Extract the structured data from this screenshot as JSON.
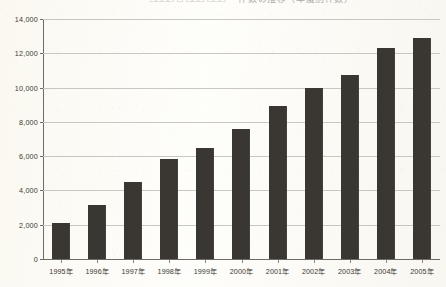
{
  "document": {
    "title_fragment": "□□□□ □ □□□ □□□ ・件数の推移（年度別件数）",
    "background_color": "#fbfaf6"
  },
  "chart_data": {
    "type": "bar",
    "title": "",
    "xlabel": "",
    "ylabel": "",
    "categories": [
      "1995年",
      "1996年",
      "1997年",
      "1998年",
      "1999年",
      "2000年",
      "2001年",
      "2002年",
      "2003年",
      "2004年",
      "2005年"
    ],
    "values": [
      2100,
      3150,
      4500,
      5850,
      6500,
      7600,
      8900,
      10000,
      10750,
      12300,
      12900
    ],
    "ylim": [
      0,
      14000
    ],
    "ytick_values": [
      0,
      2000,
      4000,
      6000,
      8000,
      10000,
      12000,
      14000
    ],
    "ytick_labels": [
      "0",
      "2,000",
      "4,000",
      "6,000",
      "8,000",
      "10,000",
      "12,000",
      "14,000"
    ],
    "grid": true,
    "legend": "none",
    "bar_color": "#3a3631",
    "grid_color": "#c9c7c1",
    "axis_color": "#6e6b66"
  }
}
